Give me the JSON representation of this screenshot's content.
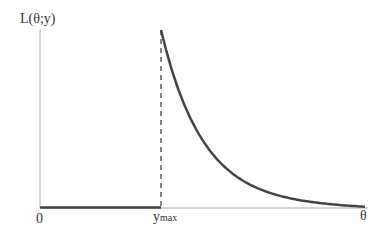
{
  "chart_data": {
    "type": "line",
    "title": "",
    "ylabel": "L(θ;y)",
    "xlabel": "θ",
    "x_ticks": [
      {
        "label": "0",
        "position": 0
      },
      {
        "label": "y",
        "subscript": "max",
        "position": "y_max"
      }
    ],
    "series": [
      {
        "name": "L(θ;y)",
        "segments": [
          {
            "x": [
              0,
              1
            ],
            "y": [
              0,
              0
            ],
            "note": "zero from 0 to y_max"
          },
          {
            "x": [
              1,
              1.2,
              1.4,
              1.6,
              1.8,
              2.0,
              2.3,
              2.6,
              2.9,
              3.2
            ],
            "y": [
              1.0,
              0.58,
              0.36,
              0.24,
              0.17,
              0.125,
              0.082,
              0.057,
              0.041,
              0.03
            ],
            "note": "decreasing curve after y_max (x in units of y_max)"
          }
        ]
      }
    ],
    "annotations": [
      {
        "type": "dashed-vline",
        "at": "y_max",
        "from": 0,
        "to": 1.0
      }
    ],
    "grid": false,
    "legend": false
  },
  "labels": {
    "y_axis": "L(θ;y)",
    "x_axis": "θ",
    "origin": "0",
    "ymax_main": "y",
    "ymax_sub": "max"
  }
}
